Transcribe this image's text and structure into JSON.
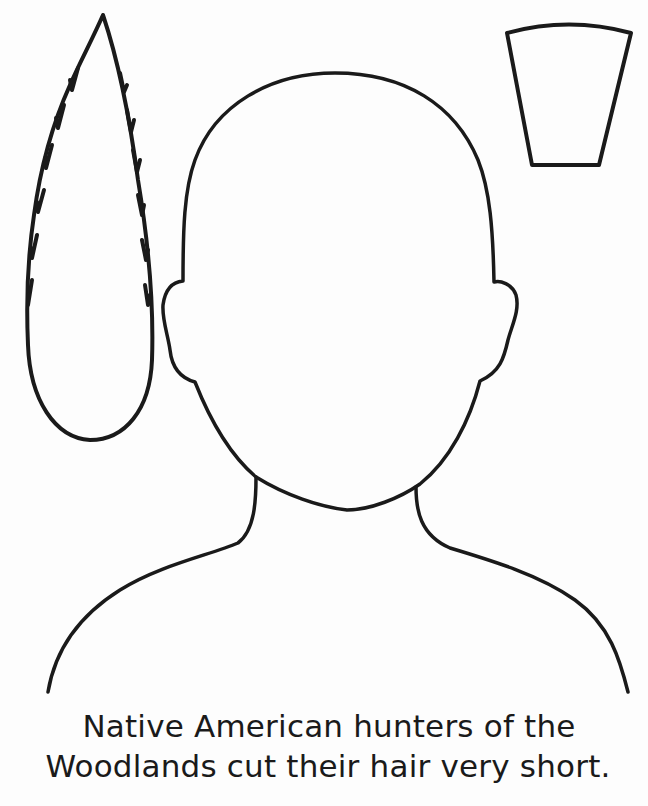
{
  "worksheet": {
    "caption": {
      "line1": "Native American hunters of the",
      "line2": "Woodlands cut their hair very short."
    },
    "cutouts": [
      {
        "name": "feather",
        "description": "feather outline"
      },
      {
        "name": "headband-piece",
        "description": "trapezoid cut-out shape"
      },
      {
        "name": "head-and-shoulders",
        "description": "blank face and shoulders outline"
      }
    ],
    "colors": {
      "ink": "#1a1a1a",
      "paper": "#fdfdfd"
    }
  }
}
